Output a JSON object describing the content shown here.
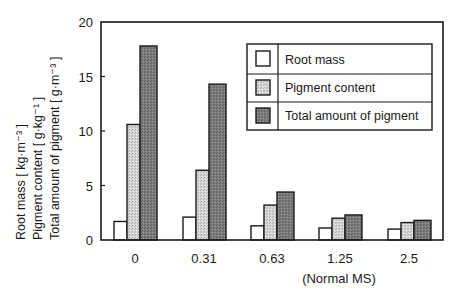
{
  "chart_data": {
    "type": "bar",
    "title": "",
    "xlabel": "",
    "ylabel_lines": [
      "Root mass  [ kg·m⁻³ ]",
      "Pigment content  [ g·kg⁻¹ ]",
      "Total amount of pigment  [ g·m⁻³ ]"
    ],
    "categories": [
      "0",
      "0.31",
      "0.63",
      "1.25",
      "2.5"
    ],
    "category_annotations": {
      "1.25": "(Normal MS)"
    },
    "series": [
      {
        "name": "Root mass",
        "values": [
          1.7,
          2.1,
          1.3,
          1.1,
          1.0
        ],
        "color": "#ffffff",
        "pattern": "none"
      },
      {
        "name": "Pigment content",
        "values": [
          10.6,
          6.4,
          3.2,
          2.0,
          1.6
        ],
        "color": "#c8c8c8",
        "pattern": "light-dots"
      },
      {
        "name": "Total amount of pigment",
        "values": [
          17.8,
          14.3,
          4.4,
          2.3,
          1.8
        ],
        "color": "#7a7a7a",
        "pattern": "dark-dots"
      }
    ],
    "ylim": [
      0,
      20
    ],
    "yticks": [
      0,
      5,
      10,
      15,
      20
    ],
    "grid": false,
    "legend_position": "upper-right"
  },
  "colors": {
    "axis": "#1a1a1a",
    "root_mass_fill": "#ffffff",
    "pigment_content_fill": "#c8c8c8",
    "total_pigment_fill": "#7a7a7a"
  }
}
